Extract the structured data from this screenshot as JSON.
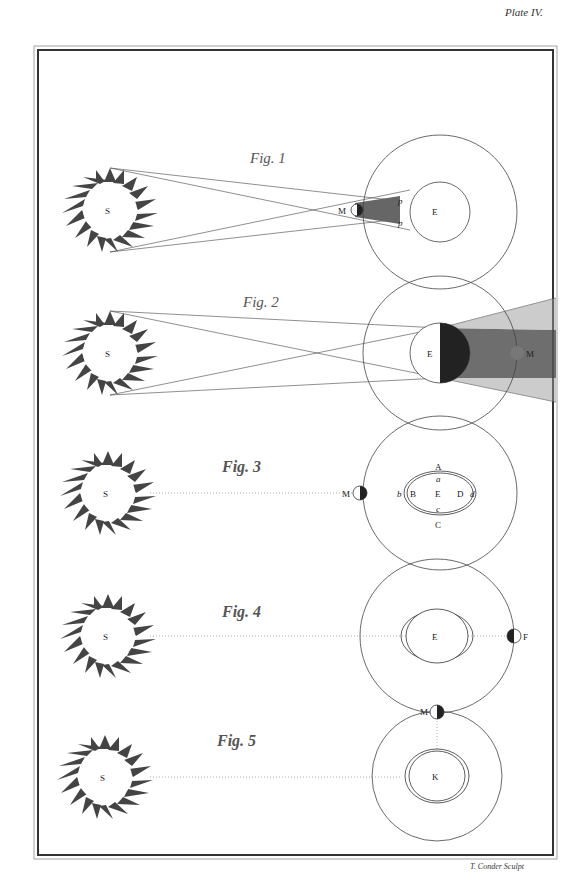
{
  "plate": {
    "label": "Plate IV.",
    "engraver": "T. Conder Sculpt"
  },
  "figures": [
    {
      "title": "Fig. 1",
      "sun_label": "S",
      "earth_label": "E",
      "moon_label": "M",
      "penumbra_labels": [
        "p",
        "p"
      ],
      "description": "Sun S casting converging rays past Moon M onto Earth E within its orbit circle (solar eclipse geometry)"
    },
    {
      "title": "Fig. 2",
      "sun_label": "S",
      "earth_label": "E",
      "moon_label": "M",
      "description": "Sun S casting rays past Earth E, whose dark shadow cone extends to Moon M (lunar eclipse geometry)"
    },
    {
      "title": "Fig. 3",
      "sun_label": "S",
      "moon_label": "M",
      "earth_label": "E",
      "tide_labels": [
        "A",
        "a",
        "B",
        "b",
        "D",
        "d",
        "c",
        "C"
      ],
      "description": "Sun S in line with Moon M and Earth E with tidal ellipse ABCD"
    },
    {
      "title": "Fig. 4",
      "sun_label": "S",
      "earth_label": "E",
      "moon_label": "F",
      "description": "Sun S aligned with Earth E and Moon F at opposition"
    },
    {
      "title": "Fig. 5",
      "sun_label": "S",
      "earth_label": "K",
      "moon_label": "M",
      "description": "Sun S with Earth K and Moon M at quadrature"
    }
  ]
}
